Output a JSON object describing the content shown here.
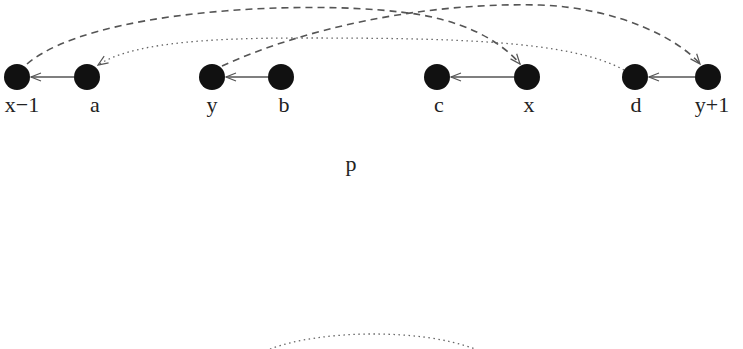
{
  "diagram": {
    "nodes": [
      {
        "id": "x-1",
        "label": "x−1",
        "cx": 17,
        "cy": 77
      },
      {
        "id": "a",
        "label": "a",
        "cx": 87,
        "cy": 77
      },
      {
        "id": "y",
        "label": "y",
        "cx": 212,
        "cy": 77
      },
      {
        "id": "b",
        "label": "b",
        "cx": 281,
        "cy": 77
      },
      {
        "id": "c",
        "label": "c",
        "cx": 437,
        "cy": 77
      },
      {
        "id": "x",
        "label": "x",
        "cx": 527,
        "cy": 77
      },
      {
        "id": "d",
        "label": "d",
        "cx": 635,
        "cy": 77
      },
      {
        "id": "y+1",
        "label": "y+1",
        "cx": 708,
        "cy": 77
      }
    ],
    "edges": [
      {
        "from": "a",
        "to": "x-1",
        "style": "solid"
      },
      {
        "from": "b",
        "to": "y",
        "style": "solid"
      },
      {
        "from": "x",
        "to": "c",
        "style": "solid"
      },
      {
        "from": "y+1",
        "to": "d",
        "style": "solid"
      },
      {
        "from": "x-1",
        "to": "x",
        "style": "dashed"
      },
      {
        "from": "y",
        "to": "y+1",
        "style": "dashed"
      },
      {
        "from": "d",
        "to": "a",
        "style": "dotted"
      }
    ],
    "center_label": "p",
    "colors": {
      "node": "#111111",
      "edge": "#555555",
      "text": "#222222"
    }
  }
}
